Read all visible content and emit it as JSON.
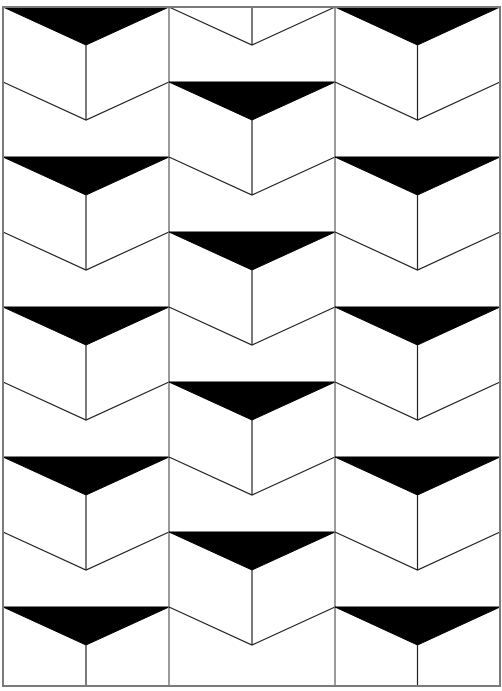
{
  "pattern": {
    "name": "chevron-tumbling-blocks",
    "colors": {
      "background": "#ffffff",
      "line": "#222222",
      "border": "#7a7a7a",
      "fill": "#000000"
    },
    "frame": {
      "left": 3,
      "top": 7,
      "right": 500,
      "bottom": 686
    },
    "columns": [
      {
        "id": "left",
        "x0": 3,
        "x1": 169,
        "black_starts": [
          7,
          157,
          307,
          457,
          607
        ],
        "v_starts": [
          82,
          232,
          382,
          532
        ]
      },
      {
        "id": "middle",
        "x0": 169,
        "x1": 335,
        "black_starts": [
          82,
          232,
          382,
          532
        ],
        "v_starts": [
          7,
          157,
          307,
          457,
          607
        ]
      },
      {
        "id": "right",
        "x0": 335,
        "x1": 500,
        "black_starts": [
          7,
          157,
          307,
          457,
          607
        ],
        "v_starts": [
          82,
          232,
          382,
          532
        ]
      }
    ],
    "chevron_depth": 38,
    "row_pitch": 75
  }
}
